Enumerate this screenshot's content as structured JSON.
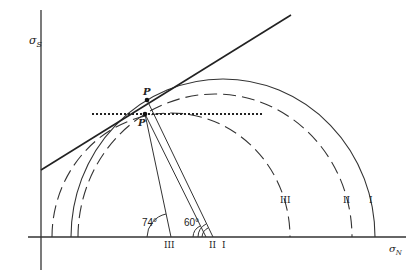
{
  "diagram": {
    "type": "Mohr circle diagram",
    "axes": {
      "x_label": "σ",
      "x_subscript": "N",
      "y_label": "σ",
      "y_subscript": "S"
    },
    "circles": [
      {
        "label": "I",
        "style": "solid"
      },
      {
        "label": "II",
        "style": "dashed"
      },
      {
        "label": "III",
        "style": "dashed"
      }
    ],
    "points": [
      {
        "label": "P",
        "position": "upper"
      },
      {
        "label": "P",
        "position": "lower"
      }
    ],
    "angles": [
      {
        "label": "74°"
      },
      {
        "label": "60°"
      }
    ],
    "axis_markers": [
      "III",
      "II",
      "I"
    ],
    "lines": [
      "tangent failure envelope (solid)",
      "horizontal dotted line through P"
    ]
  }
}
